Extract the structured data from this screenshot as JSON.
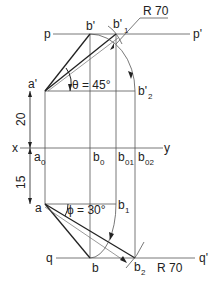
{
  "diagram": {
    "type": "orthographic-projection-line-true-length",
    "colors": {
      "line": "#555555",
      "thick": "#222222",
      "text": "#222222",
      "background": "#ffffff"
    },
    "reference_lines": {
      "p": "p",
      "p_prime": "p'",
      "x": "x",
      "y": "y",
      "q": "q",
      "q_prime": "q'"
    },
    "points": {
      "a_prime": "a'",
      "b_prime": "b'",
      "b_prime_1": "b'",
      "b_prime_1_sub": "1",
      "b_prime_2": "b'",
      "b_prime_2_sub": "2",
      "a0": "a",
      "a0_sub": "0",
      "b0": "b",
      "b0_sub": "0",
      "b01": "b",
      "b01_sub": "01",
      "b02": "b",
      "b02_sub": "02",
      "a": "a",
      "b1": "b",
      "b1_sub": "1",
      "b": "b",
      "b2": "b",
      "b2_sub": "2"
    },
    "angles": {
      "theta": "θ = 45°",
      "phi": "ϕ = 30°"
    },
    "dimensions": {
      "front_height": "20",
      "top_depth": "15",
      "radius_top": "R 70",
      "radius_bottom": "R 70"
    }
  }
}
